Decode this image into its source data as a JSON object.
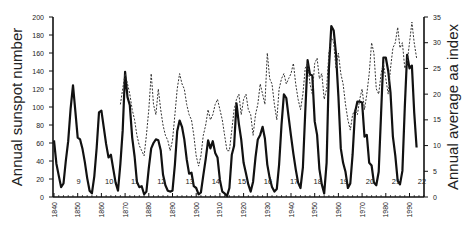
{
  "chart_data": {
    "type": "line",
    "title": "",
    "xlabel": "",
    "ylabel": "Annual sunspot number",
    "y2label": "Annual average aa index",
    "xlim": [
      1840,
      1996
    ],
    "ylim": [
      0,
      200
    ],
    "y2lim": [
      0,
      35
    ],
    "x_ticks": [
      "1840",
      "1850",
      "1860",
      "1870",
      "1880",
      "1890",
      "1900",
      "1910",
      "1920",
      "1930",
      "1940",
      "1950",
      "1960",
      "1970",
      "1980",
      "1990"
    ],
    "y_ticks": [
      "0",
      "20",
      "40",
      "60",
      "80",
      "100",
      "120",
      "140",
      "160",
      "180",
      "200"
    ],
    "y2_ticks": [
      "0",
      "5",
      "10",
      "15",
      "20",
      "25",
      "30",
      "35"
    ],
    "grid": false,
    "legend": null,
    "cycle_labels": [
      {
        "label": "9",
        "year": 1847
      },
      {
        "label": "10",
        "year": 1859
      },
      {
        "label": "11",
        "year": 1870
      },
      {
        "label": "12",
        "year": 1881
      },
      {
        "label": "13",
        "year": 1893
      },
      {
        "label": "14",
        "year": 1904
      },
      {
        "label": "15",
        "year": 1915
      },
      {
        "label": "16",
        "year": 1926
      },
      {
        "label": "17",
        "year": 1937
      },
      {
        "label": "18",
        "year": 1947
      },
      {
        "label": "19",
        "year": 1958
      },
      {
        "label": "20",
        "year": 1969
      },
      {
        "label": "21",
        "year": 1980
      },
      {
        "label": "22",
        "year": 1991
      }
    ],
    "series": [
      {
        "name": "Annual sunspot number",
        "axis": "left",
        "style": "solid",
        "x": [
          1840,
          1841,
          1842,
          1843,
          1844,
          1845,
          1846,
          1847,
          1848,
          1849,
          1850,
          1851,
          1852,
          1853,
          1854,
          1855,
          1856,
          1857,
          1858,
          1859,
          1860,
          1861,
          1862,
          1863,
          1864,
          1865,
          1866,
          1867,
          1868,
          1869,
          1870,
          1871,
          1872,
          1873,
          1874,
          1875,
          1876,
          1877,
          1878,
          1879,
          1880,
          1881,
          1882,
          1883,
          1884,
          1885,
          1886,
          1887,
          1888,
          1889,
          1890,
          1891,
          1892,
          1893,
          1894,
          1895,
          1896,
          1897,
          1898,
          1899,
          1900,
          1901,
          1902,
          1903,
          1904,
          1905,
          1906,
          1907,
          1908,
          1909,
          1910,
          1911,
          1912,
          1913,
          1914,
          1915,
          1916,
          1917,
          1918,
          1919,
          1920,
          1921,
          1922,
          1923,
          1924,
          1925,
          1926,
          1927,
          1928,
          1929,
          1930,
          1931,
          1932,
          1933,
          1934,
          1935,
          1936,
          1937,
          1938,
          1939,
          1940,
          1941,
          1942,
          1943,
          1944,
          1945,
          1946,
          1947,
          1948,
          1949,
          1950,
          1951,
          1952,
          1953,
          1954,
          1955,
          1956,
          1957,
          1958,
          1959,
          1960,
          1961,
          1962,
          1963,
          1964,
          1965,
          1966,
          1967,
          1968,
          1969,
          1970,
          1971,
          1972,
          1973,
          1974,
          1975,
          1976,
          1977,
          1978,
          1979,
          1980,
          1981,
          1982,
          1983,
          1984,
          1985,
          1986,
          1987,
          1988,
          1989,
          1990,
          1991,
          1992,
          1993
        ],
        "values": [
          63,
          37,
          24,
          11,
          15,
          40,
          62,
          98,
          124,
          96,
          66,
          64,
          54,
          39,
          21,
          7,
          4,
          23,
          55,
          94,
          96,
          77,
          59,
          44,
          47,
          31,
          16,
          7,
          37,
          74,
          139,
          111,
          102,
          66,
          45,
          17,
          11,
          12,
          3,
          6,
          32,
          54,
          60,
          64,
          63,
          52,
          25,
          13,
          7,
          6,
          7,
          36,
          73,
          85,
          78,
          64,
          42,
          26,
          27,
          12,
          10,
          3,
          5,
          24,
          42,
          63,
          54,
          62,
          49,
          44,
          19,
          6,
          4,
          1,
          10,
          47,
          57,
          104,
          81,
          64,
          38,
          26,
          14,
          6,
          17,
          44,
          64,
          69,
          78,
          65,
          36,
          21,
          11,
          6,
          9,
          36,
          80,
          114,
          110,
          89,
          68,
          48,
          31,
          16,
          10,
          33,
          93,
          152,
          136,
          135,
          84,
          69,
          31,
          14,
          4,
          38,
          142,
          190,
          185,
          159,
          112,
          54,
          38,
          28,
          10,
          15,
          47,
          94,
          106,
          106,
          105,
          67,
          69,
          38,
          35,
          16,
          13,
          28,
          93,
          155,
          155,
          140,
          116,
          67,
          46,
          18,
          14,
          29,
          100,
          158,
          143,
          146,
          94,
          55
        ]
      },
      {
        "name": "Annual average aa index",
        "axis": "right",
        "style": "dashed",
        "x": [
          1868,
          1869,
          1870,
          1871,
          1872,
          1873,
          1874,
          1875,
          1876,
          1877,
          1878,
          1879,
          1880,
          1881,
          1882,
          1883,
          1884,
          1885,
          1886,
          1887,
          1888,
          1889,
          1890,
          1891,
          1892,
          1893,
          1894,
          1895,
          1896,
          1897,
          1898,
          1899,
          1900,
          1901,
          1902,
          1903,
          1904,
          1905,
          1906,
          1907,
          1908,
          1909,
          1910,
          1911,
          1912,
          1913,
          1914,
          1915,
          1916,
          1917,
          1918,
          1919,
          1920,
          1921,
          1922,
          1923,
          1924,
          1925,
          1926,
          1927,
          1928,
          1929,
          1930,
          1931,
          1932,
          1933,
          1934,
          1935,
          1936,
          1937,
          1938,
          1939,
          1940,
          1941,
          1942,
          1943,
          1944,
          1945,
          1946,
          1947,
          1948,
          1949,
          1950,
          1951,
          1952,
          1953,
          1954,
          1955,
          1956,
          1957,
          1958,
          1959,
          1960,
          1961,
          1962,
          1963,
          1964,
          1965,
          1966,
          1967,
          1968,
          1969,
          1970,
          1971,
          1972,
          1973,
          1974,
          1975,
          1976,
          1977,
          1978,
          1979,
          1980,
          1981,
          1982,
          1983,
          1984,
          1985,
          1986,
          1987,
          1988,
          1989,
          1990,
          1991,
          1992,
          1993
        ],
        "values": [
          18,
          21,
          24,
          22,
          20,
          17,
          15,
          12,
          10,
          9,
          8,
          12,
          17,
          24,
          18,
          16,
          21,
          17,
          14,
          12,
          11,
          9,
          11,
          16,
          21,
          24,
          22,
          21,
          18,
          16,
          15,
          12,
          8,
          6,
          8,
          12,
          14,
          17,
          15,
          16,
          18,
          19,
          17,
          15,
          12,
          9,
          9,
          13,
          17,
          19,
          20,
          16,
          19,
          20,
          17,
          16,
          12,
          16,
          18,
          22,
          20,
          18,
          28,
          23,
          22,
          18,
          15,
          21,
          23,
          24,
          22,
          23,
          24,
          26,
          22,
          19,
          17,
          20,
          25,
          26,
          22,
          20,
          26,
          27,
          23,
          24,
          19,
          21,
          28,
          31,
          30,
          25,
          28,
          24,
          22,
          18,
          15,
          13,
          16,
          17,
          16,
          19,
          21,
          17,
          20,
          24,
          30,
          28,
          21,
          20,
          24,
          26,
          23,
          20,
          25,
          29,
          30,
          33,
          29,
          30,
          25,
          26,
          30,
          34,
          30,
          27
        ]
      }
    ]
  },
  "axes": {
    "left_label": "Annual sunspot number",
    "right_label": "Annual average aa index"
  }
}
